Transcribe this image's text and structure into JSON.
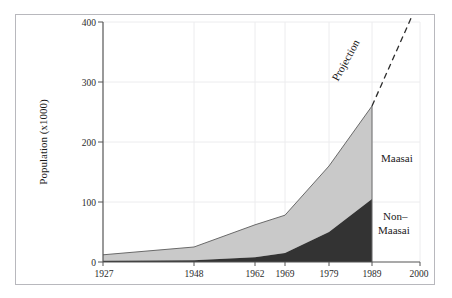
{
  "chart_data": {
    "type": "area",
    "title": "",
    "subtitle": "",
    "xlabel": "",
    "ylabel": "Population (x1000)",
    "categories": [
      "1927",
      "1948",
      "1962",
      "1969",
      "1979",
      "1989",
      "2000"
    ],
    "x": [
      1927,
      1948,
      1962,
      1969,
      1979,
      1989,
      2000
    ],
    "xlim": [
      1927,
      2000
    ],
    "ylim": [
      0,
      400
    ],
    "yticks": [
      "0",
      "100",
      "200",
      "300",
      "400"
    ],
    "ytick_values": [
      0,
      100,
      200,
      300,
      400
    ],
    "xticks": [
      "1927",
      "1948",
      "1962",
      "1969",
      "1979",
      "1989",
      "2000"
    ],
    "grid": "vertical-and-horizontal-faint",
    "legend_position": "inline-annotations",
    "stacked": true,
    "series": [
      {
        "name": "Non-Maasai",
        "color": "#333333",
        "x": [
          1927,
          1948,
          1962,
          1969,
          1979,
          1989
        ],
        "values": [
          2,
          3,
          8,
          15,
          50,
          105
        ]
      },
      {
        "name": "Maasai",
        "color": "#c9c9c9",
        "x": [
          1927,
          1948,
          1962,
          1969,
          1979,
          1989
        ],
        "values": [
          10,
          22,
          54,
          63,
          110,
          155
        ]
      }
    ],
    "totals": {
      "name": "Total population",
      "x": [
        1927,
        1948,
        1962,
        1969,
        1979,
        1989
      ],
      "values": [
        12,
        25,
        62,
        78,
        160,
        260
      ]
    },
    "projection": {
      "label": "Projection",
      "style": "dashed",
      "color": "#2b2b2b",
      "x": [
        1989,
        2000
      ],
      "values": [
        260,
        440
      ],
      "note": "dashed line continues beyond top of plot area"
    },
    "annotations": [
      {
        "text": "Maasai",
        "target_series": "Maasai"
      },
      {
        "text": "Non–\nMaasai",
        "target_series": "Non-Maasai"
      },
      {
        "text": "Projection",
        "target_series": "projection",
        "rotated": true
      }
    ]
  },
  "labels": {
    "y_axis_title": "Population (x1000)",
    "series_maasai": "Maasai",
    "series_non_maasai_line1": "Non–",
    "series_non_maasai_line2": "Maasai",
    "projection": "Projection"
  },
  "yticks": {
    "t0": "0",
    "t1": "100",
    "t2": "200",
    "t3": "300",
    "t4": "400"
  },
  "xticks": {
    "t0": "1927",
    "t1": "1948",
    "t2": "1962",
    "t3": "1969",
    "t4": "1979",
    "t5": "1989",
    "t6": "2000"
  },
  "colors": {
    "maasai_fill": "#c9c9c9",
    "non_maasai_fill": "#333333",
    "axis": "#555555",
    "grid": "#e8e8ea",
    "frame": "#b8b8bd",
    "text": "#1a1a1a"
  }
}
